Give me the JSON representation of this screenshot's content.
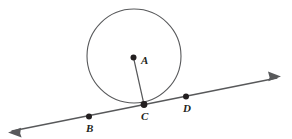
{
  "figure": {
    "background_color": "#ffffff",
    "stroke_color": "#58595b",
    "dot_color": "#231f20",
    "label_color": "#231f20",
    "circle": {
      "name": "circle-A",
      "center_x": 134,
      "center_y": 56,
      "radius": 47,
      "stroke_width": 1.1
    },
    "radius_segment": {
      "name": "segment-AC",
      "x1": 133.5,
      "y1": 57.5,
      "x2": 144,
      "y2": 104.5,
      "stroke_width": 1.2
    },
    "tangent_line": {
      "name": "line-BD",
      "x1": 12,
      "y1": 131,
      "x2": 277,
      "y2": 78,
      "stroke_width": 1.3,
      "arrow_start": true,
      "arrow_end": true
    },
    "points": [
      {
        "id": "A",
        "label": "A",
        "cx": 133.5,
        "cy": 57.5,
        "r": 3.0,
        "label_x": 141,
        "label_y": 64
      },
      {
        "id": "B",
        "label": "B",
        "cx": 89,
        "cy": 116.5,
        "r": 3.0,
        "label_x": 86,
        "label_y": 132
      },
      {
        "id": "C",
        "label": "C",
        "cx": 144,
        "cy": 104.5,
        "r": 3.4,
        "label_x": 141,
        "label_y": 120
      },
      {
        "id": "D",
        "label": "D",
        "cx": 186,
        "cy": 96.5,
        "r": 3.0,
        "label_x": 183,
        "label_y": 112
      }
    ]
  }
}
